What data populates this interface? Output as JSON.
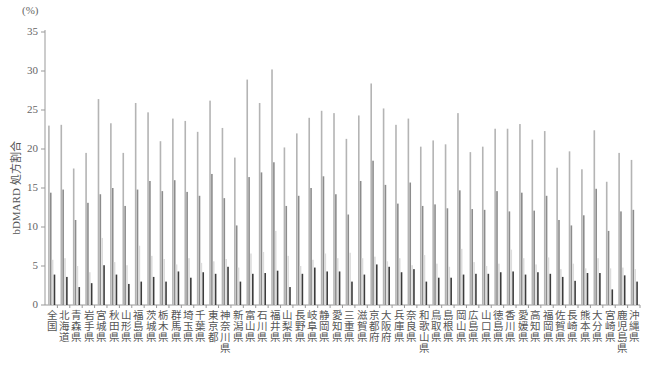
{
  "chart_data": {
    "type": "bar",
    "title": "",
    "unit_label": "(%)",
    "xlabel": "",
    "ylabel": "bDMARD 処方割合",
    "ylim": [
      0,
      35
    ],
    "yticks": [
      0,
      5,
      10,
      15,
      20,
      25,
      30,
      35
    ],
    "grid": false,
    "legend": null,
    "categories": [
      "全国",
      "北海道",
      "青森県",
      "岩手県",
      "宮城県",
      "秋田県",
      "山形県",
      "福島県",
      "茨城県",
      "栃木県",
      "群馬県",
      "埼玉県",
      "千葉県",
      "東京都",
      "神奈川県",
      "新潟県",
      "富山県",
      "石川県",
      "福井県",
      "山梨県",
      "長野県",
      "岐阜県",
      "静岡県",
      "愛知県",
      "三重県",
      "滋賀県",
      "京都府",
      "大阪府",
      "兵庫県",
      "奈良県",
      "和歌山県",
      "鳥取県",
      "島根県",
      "岡山県",
      "広島県",
      "山口県",
      "徳島県",
      "香川県",
      "愛媛県",
      "高知県",
      "福岡県",
      "佐賀県",
      "長崎県",
      "熊本県",
      "大分県",
      "宮崎県",
      "鹿児島県",
      "沖縄県"
    ],
    "series": [
      {
        "name": "series1",
        "color": "#b4b4b4",
        "values": [
          23.0,
          23.1,
          17.5,
          19.5,
          26.4,
          23.3,
          19.5,
          25.9,
          24.7,
          21.0,
          23.9,
          23.6,
          22.2,
          26.2,
          22.7,
          18.9,
          28.9,
          25.9,
          30.2,
          20.2,
          22.0,
          24.0,
          24.9,
          24.6,
          21.3,
          24.3,
          28.4,
          25.2,
          23.1,
          23.9,
          20.3,
          21.1,
          20.6,
          24.6,
          19.6,
          20.3,
          22.6,
          22.6,
          23.2,
          21.2,
          22.3,
          17.6,
          19.7,
          17.4,
          22.4,
          15.8,
          19.5,
          18.6
        ]
      },
      {
        "name": "series2",
        "color": "#8c8c8c",
        "values": [
          14.4,
          14.8,
          10.9,
          13.1,
          14.2,
          15.0,
          12.7,
          14.8,
          15.9,
          14.6,
          16.0,
          14.5,
          14.0,
          16.8,
          13.7,
          10.2,
          16.4,
          17.0,
          18.3,
          12.7,
          14.0,
          15.0,
          16.5,
          14.2,
          11.6,
          15.9,
          18.5,
          15.4,
          13.0,
          15.7,
          12.7,
          12.9,
          12.4,
          14.7,
          12.3,
          12.2,
          14.6,
          12.0,
          14.4,
          12.1,
          14.0,
          10.9,
          10.2,
          11.5,
          14.9,
          9.5,
          12.0,
          12.2
        ]
      },
      {
        "name": "series3",
        "color": "#dcdcdc",
        "values": [
          5.8,
          6.0,
          5.0,
          4.2,
          8.6,
          5.5,
          5.1,
          7.6,
          6.3,
          5.9,
          5.2,
          6.0,
          5.4,
          5.6,
          5.9,
          4.8,
          6.6,
          6.8,
          9.5,
          6.3,
          5.0,
          5.8,
          6.6,
          6.0,
          6.7,
          6.0,
          6.2,
          5.6,
          6.0,
          5.1,
          6.4,
          5.3,
          4.9,
          7.2,
          5.5,
          5.0,
          5.3,
          7.1,
          6.0,
          5.2,
          6.1,
          4.6,
          5.3,
          4.7,
          6.0,
          4.7,
          4.8,
          4.6
        ]
      },
      {
        "name": "series4",
        "color": "#3c3c3c",
        "values": [
          3.9,
          3.6,
          2.3,
          2.8,
          5.1,
          3.9,
          2.7,
          3.0,
          3.6,
          3.0,
          4.3,
          3.5,
          4.2,
          4.0,
          4.9,
          3.0,
          4.0,
          4.1,
          4.4,
          2.3,
          4.0,
          4.8,
          4.3,
          4.3,
          3.0,
          3.9,
          5.2,
          4.9,
          4.2,
          4.6,
          3.0,
          3.5,
          3.5,
          3.9,
          4.0,
          4.0,
          4.2,
          4.3,
          3.9,
          4.2,
          4.0,
          3.6,
          3.1,
          4.1,
          4.1,
          2.0,
          3.8,
          3.0
        ]
      }
    ]
  }
}
